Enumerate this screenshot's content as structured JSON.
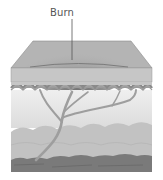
{
  "figure": {
    "type": "skin-cross-section",
    "labels": [
      {
        "text": "Burn",
        "target": "burn-area"
      }
    ]
  },
  "colors": {
    "epidermis_top": "#a8a8a8",
    "epidermis_side": "#c4c4c4",
    "burn_center": "#606060",
    "papillae": "#9a9a9a",
    "dermis": "#e8e8e8",
    "vessels": "#a0a0a0",
    "fat": "#c0c0c0",
    "muscle": "#7a7a7a",
    "leader_line": "#555555"
  }
}
